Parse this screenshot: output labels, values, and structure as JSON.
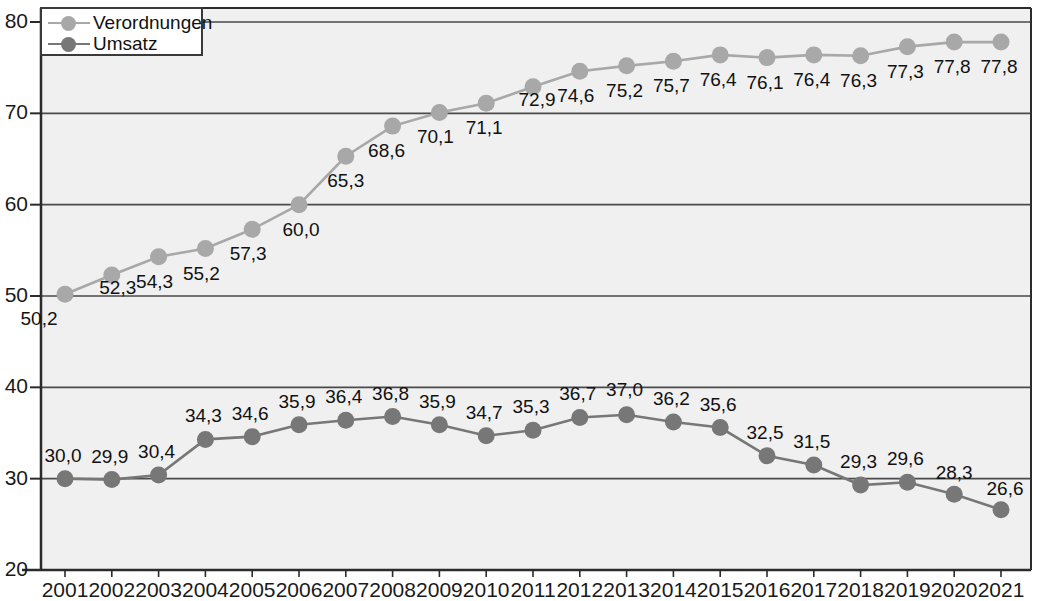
{
  "chart_data": {
    "type": "line",
    "title": "",
    "subtitle": "",
    "xlabel": "",
    "ylabel": "",
    "ylim": [
      20,
      80
    ],
    "ytick_labels": [
      "20",
      "30",
      "40",
      "50",
      "60",
      "70",
      "80"
    ],
    "yticks": [
      20,
      30,
      40,
      50,
      60,
      70,
      80
    ],
    "grid": true,
    "legend_position": "top-left",
    "categories": [
      "2001",
      "2002",
      "2003",
      "2004",
      "2005",
      "2006",
      "2007",
      "2008",
      "2009",
      "2010",
      "2011",
      "2012",
      "2013",
      "2014",
      "2015",
      "2016",
      "2017",
      "2018",
      "2019",
      "2020",
      "2021"
    ],
    "series": [
      {
        "name": "Verordnungen",
        "color": "#a8a8a8",
        "values": [
          50.2,
          52.3,
          54.3,
          55.2,
          57.3,
          60.0,
          65.3,
          68.6,
          70.1,
          71.1,
          72.9,
          74.6,
          75.2,
          75.7,
          76.4,
          76.1,
          76.4,
          76.3,
          77.3,
          77.8,
          77.8
        ],
        "labels": [
          "50,2",
          "52,3",
          "54,3",
          "55,2",
          "57,3",
          "60,0",
          "65,3",
          "68,6",
          "70,1",
          "71,1",
          "72,9",
          "74,6",
          "75,2",
          "75,7",
          "76,4",
          "76,1",
          "76,4",
          "76,3",
          "77,3",
          "77,8",
          "77,8"
        ]
      },
      {
        "name": "Umsatz",
        "color": "#777777",
        "values": [
          30.0,
          29.9,
          30.4,
          34.3,
          34.6,
          35.9,
          36.4,
          36.8,
          35.9,
          34.7,
          35.3,
          36.7,
          37.0,
          36.2,
          35.6,
          32.5,
          31.5,
          29.3,
          29.6,
          28.3,
          26.6
        ],
        "labels": [
          "30,0",
          "29,9",
          "30,4",
          "34,3",
          "34,6",
          "35,9",
          "36,4",
          "36,8",
          "35,9",
          "34,7",
          "35,3",
          "36,7",
          "37,0",
          "36,2",
          "35,6",
          "32,5",
          "31,5",
          "29,3",
          "29,6",
          "28,3",
          "26,6"
        ]
      }
    ]
  },
  "legend": {
    "items": [
      {
        "label": "Verordnungen",
        "color": "#a8a8a8"
      },
      {
        "label": "Umsatz",
        "color": "#777777"
      }
    ]
  },
  "colors": {
    "plot_background": "#f0f0f0",
    "grid_line": "#4a4a4a",
    "axis_line": "#2b2b2b",
    "verordnungen": "#a8a8a8",
    "umsatz": "#777777",
    "text": "#111111"
  }
}
